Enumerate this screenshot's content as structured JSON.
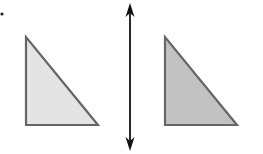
{
  "diagram": {
    "background": "#ffffff",
    "marker_dot": {
      "x": 2,
      "y": 14,
      "r": 1.6,
      "color": "#222222"
    },
    "mirror_line": {
      "x": 130,
      "y1": 3,
      "y2": 151,
      "color": "#111111",
      "arrows": [
        "up",
        "down"
      ]
    },
    "shapes": [
      {
        "name": "original-triangle",
        "points": [
          [
            26,
            37
          ],
          [
            26,
            125
          ],
          [
            98,
            125
          ]
        ],
        "fill": "#e4e4e4",
        "stroke": "#666666"
      },
      {
        "name": "reflected-triangle",
        "points": [
          [
            165,
            37
          ],
          [
            165,
            125
          ],
          [
            237,
            125
          ]
        ],
        "fill": "#c2c2c2",
        "stroke": "#666666"
      }
    ]
  }
}
